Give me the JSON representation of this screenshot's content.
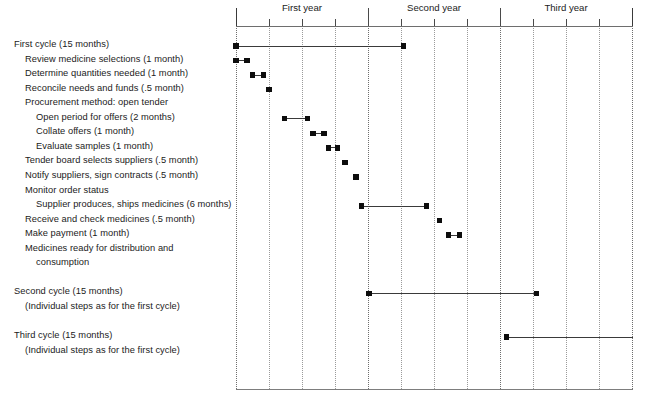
{
  "chart_data": {
    "type": "bar",
    "chart_kind": "gantt",
    "title": "",
    "xlabel": "",
    "ylabel": "",
    "axis": {
      "unit": "month",
      "xlim": [
        0,
        37
      ],
      "year_boundaries": [
        0,
        12,
        24,
        36
      ],
      "minor_tick_interval_months": 3,
      "major_tick_interval_months": 12,
      "grid": "vertical dotted quarterly",
      "legend": "none"
    },
    "year_labels": [
      {
        "label": "First year",
        "center_month": 6
      },
      {
        "label": "Second year",
        "center_month": 18
      },
      {
        "label": "Third year",
        "center_month": 30
      }
    ],
    "categories": [
      "First cycle (15 months)",
      "Review medicine selections (1 month)",
      "Determine quantities needed (1 month)",
      "Reconcile needs and funds (.5 month)",
      "Procurement method: open tender",
      "Open period for offers (2 months)",
      "Collate offers (1 month)",
      "Evaluate samples (1 month)",
      "Tender board selects suppliers (.5 month)",
      "Notify suppliers, sign contracts (.5 month)",
      "Monitor order status",
      "Supplier produces, ships medicines (6 months)",
      "Receive and check medicines (.5 month)",
      "Make payment (1 month)",
      "Medicines ready for distribution and",
      "consumption",
      "Second cycle (15 months)",
      "(Individual steps as for the first cycle)",
      "Third cycle (15 months)",
      "(Individual steps as for the first cycle)"
    ],
    "tasks": [
      {
        "name": "First cycle (15 months)",
        "indent": 0,
        "row": 0,
        "start_month": 0,
        "duration_months": 15.2,
        "bar": true
      },
      {
        "name": "Review medicine selections (1 month)",
        "indent": 1,
        "row": 1,
        "start_month": 0,
        "duration_months": 1.0,
        "bar": true
      },
      {
        "name": "Determine quantities needed (1 month)",
        "indent": 1,
        "row": 2,
        "start_month": 1.5,
        "duration_months": 1.0,
        "bar": true
      },
      {
        "name": "Reconcile needs and funds (.5 month)",
        "indent": 1,
        "row": 3,
        "start_month": 3.0,
        "duration_months": 0.0,
        "bar": false
      },
      {
        "name": "Procurement method: open tender",
        "indent": 1,
        "row": 4,
        "start_month": null,
        "duration_months": null,
        "bar": false
      },
      {
        "name": "Open period for offers (2 months)",
        "indent": 2,
        "row": 5,
        "start_month": 4.4,
        "duration_months": 2.1,
        "bar": true
      },
      {
        "name": "Collate offers (1 month)",
        "indent": 2,
        "row": 6,
        "start_month": 7.0,
        "duration_months": 1.0,
        "bar": true
      },
      {
        "name": "Evaluate samples (1 month)",
        "indent": 2,
        "row": 7,
        "start_month": 8.4,
        "duration_months": 0.8,
        "bar": true
      },
      {
        "name": "Tender board selects suppliers (.5 month)",
        "indent": 1,
        "row": 8,
        "start_month": 9.9,
        "duration_months": 0.0,
        "bar": false
      },
      {
        "name": "Notify suppliers, sign contracts (.5 month)",
        "indent": 1,
        "row": 9,
        "start_month": 10.9,
        "duration_months": 0.0,
        "bar": false
      },
      {
        "name": "Monitor order status",
        "indent": 1,
        "row": 10,
        "start_month": null,
        "duration_months": null,
        "bar": false
      },
      {
        "name": "Supplier produces, ships medicines (6 months)",
        "indent": 2,
        "row": 11,
        "start_month": 11.4,
        "duration_months": 5.9,
        "bar": true
      },
      {
        "name": "Receive and check medicines (.5 month)",
        "indent": 1,
        "row": 12,
        "start_month": 18.5,
        "duration_months": 0.0,
        "bar": false
      },
      {
        "name": "Make payment (1 month)",
        "indent": 1,
        "row": 13,
        "start_month": 19.3,
        "duration_months": 1.0,
        "bar": true
      },
      {
        "name": "Medicines ready for distribution and",
        "indent": 1,
        "row": 14,
        "start_month": null,
        "duration_months": null,
        "bar": false
      },
      {
        "name": "consumption",
        "indent": 2,
        "row": 15,
        "start_month": null,
        "duration_months": null,
        "bar": false
      },
      {
        "name": "Second cycle (15 months)",
        "indent": 0,
        "row": 17,
        "start_month": 12.1,
        "duration_months": 15.2,
        "bar": true
      },
      {
        "name": "(Individual steps as for the first cycle)",
        "indent": 1,
        "row": 18,
        "start_month": null,
        "duration_months": null,
        "bar": false
      },
      {
        "name": "Third cycle (15 months)",
        "indent": 0,
        "row": 20,
        "start_month": 24.6,
        "duration_months": 12.4,
        "bar": true
      },
      {
        "name": "(Individual steps as for the first cycle)",
        "indent": 1,
        "row": 21,
        "start_month": null,
        "duration_months": null,
        "bar": false
      }
    ],
    "colors": {
      "bar": "#3a3a3a",
      "marker": "#0d0d0d",
      "gridline": "#9a9a9a",
      "axis": "#6e6e6e",
      "text": "#1b1b1b",
      "background": "#ffffff"
    }
  }
}
